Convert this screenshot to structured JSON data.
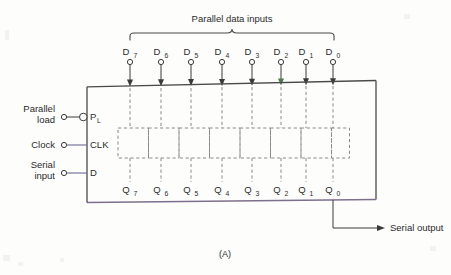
{
  "figure": {
    "caption": "(A)",
    "title_bracket_label": "Parallel data inputs",
    "serial_output_label": "Serial output"
  },
  "left_pins": [
    {
      "label": "Parallel",
      "label2": "load",
      "pin": "P",
      "pin_sub": "L",
      "inverting": true,
      "y": 117
    },
    {
      "label": "Clock",
      "label2": "",
      "pin": "CLK",
      "pin_sub": "",
      "inverting": false,
      "y": 145
    },
    {
      "label": "Serial",
      "label2": "input",
      "pin": "D",
      "pin_sub": "S",
      "inverting": false,
      "y": 173
    }
  ],
  "data_inputs": [
    {
      "name": "D",
      "sub": "7",
      "x": 130
    },
    {
      "name": "D",
      "sub": "6",
      "x": 161
    },
    {
      "name": "D",
      "sub": "5",
      "x": 191
    },
    {
      "name": "D",
      "sub": "4",
      "x": 222
    },
    {
      "name": "D",
      "sub": "3",
      "x": 252
    },
    {
      "name": "D",
      "sub": "2",
      "x": 281
    },
    {
      "name": "D",
      "sub": "1",
      "x": 306
    },
    {
      "name": "D",
      "sub": "0",
      "x": 333
    }
  ],
  "data_outputs": [
    {
      "name": "Q",
      "sub": "7",
      "x": 130
    },
    {
      "name": "Q",
      "sub": "6",
      "x": 161
    },
    {
      "name": "Q",
      "sub": "5",
      "x": 191
    },
    {
      "name": "Q",
      "sub": "4",
      "x": 222
    },
    {
      "name": "Q",
      "sub": "3",
      "x": 252
    },
    {
      "name": "Q",
      "sub": "2",
      "x": 281
    },
    {
      "name": "Q",
      "sub": "1",
      "x": 306
    },
    {
      "name": "Q",
      "sub": "0",
      "x": 333
    }
  ],
  "colors": {
    "ink": "#3a3a3a",
    "dashed": "#8a8a8a",
    "tint": "#6b6a95",
    "background": "#fdfdfc"
  }
}
